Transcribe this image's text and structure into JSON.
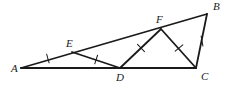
{
  "figure": {
    "type": "geometry-diagram",
    "canvas": {
      "width": 228,
      "height": 87
    },
    "colors": {
      "background": "#ffffff",
      "stroke": "#1a1a1a",
      "label": "#1a1a1a"
    },
    "points": [
      {
        "id": "A",
        "label": "A",
        "x": 21,
        "y": 68,
        "label_x": 11,
        "label_y": 72
      },
      {
        "id": "B",
        "label": "B",
        "x": 207,
        "y": 14,
        "label_x": 213,
        "label_y": 10
      },
      {
        "id": "C",
        "label": "C",
        "x": 196,
        "y": 68,
        "label_x": 201,
        "label_y": 80
      },
      {
        "id": "D",
        "label": "D",
        "x": 120,
        "y": 68,
        "label_x": 118,
        "label_y": 81
      },
      {
        "id": "E",
        "label": "E",
        "x": 72,
        "y": 52,
        "label_x": 68,
        "label_y": 47
      },
      {
        "id": "F",
        "label": "F",
        "x": 161,
        "y": 29,
        "label_x": 158,
        "label_y": 23
      }
    ],
    "segments": [
      {
        "id": "AB",
        "from": "A",
        "to": "B",
        "width": 1.8
      },
      {
        "id": "AC",
        "from": "A",
        "to": "C",
        "width": 2.2
      },
      {
        "id": "CB",
        "from": "C",
        "to": "B",
        "width": 1.8
      },
      {
        "id": "ED",
        "from": "E",
        "to": "D",
        "width": 1.8
      },
      {
        "id": "DF",
        "from": "D",
        "to": "F",
        "width": 1.8
      },
      {
        "id": "FC",
        "from": "F",
        "to": "C",
        "width": 1.8
      }
    ],
    "tick_marks": [
      {
        "id": "tick-AE",
        "segment": "AE",
        "x": 48,
        "y": 59,
        "angle": -16
      },
      {
        "id": "tick-ED",
        "segment": "ED",
        "x": 96,
        "y": 60,
        "angle": 18
      },
      {
        "id": "tick-DF",
        "segment": "DF",
        "x": 141,
        "y": 48,
        "angle": -44
      },
      {
        "id": "tick-FC",
        "segment": "FC",
        "x": 179,
        "y": 48,
        "angle": 50
      },
      {
        "id": "tick-CB",
        "segment": "CB",
        "x": 202,
        "y": 41,
        "angle": -10
      }
    ],
    "congruent_set": [
      "AE",
      "ED",
      "DF",
      "FC",
      "CB"
    ]
  }
}
